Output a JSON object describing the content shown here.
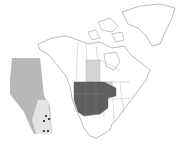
{
  "map": {
    "title": "",
    "region": "North America",
    "inset_region": "Alberta",
    "colors": {
      "land": "#ffffff",
      "borders": "#9a9a9a",
      "range_dark": "#5f5f5f",
      "range_light": "#d4d4d4",
      "inset_fill": "#b8b8b8",
      "inset_light": "#e4e4e4",
      "points": "#111111"
    },
    "inset_points": [
      {
        "x": 46,
        "y": 116
      },
      {
        "x": 49,
        "y": 119
      },
      {
        "x": 44,
        "y": 121
      },
      {
        "x": 44,
        "y": 131
      },
      {
        "x": 48,
        "y": 131
      }
    ]
  }
}
